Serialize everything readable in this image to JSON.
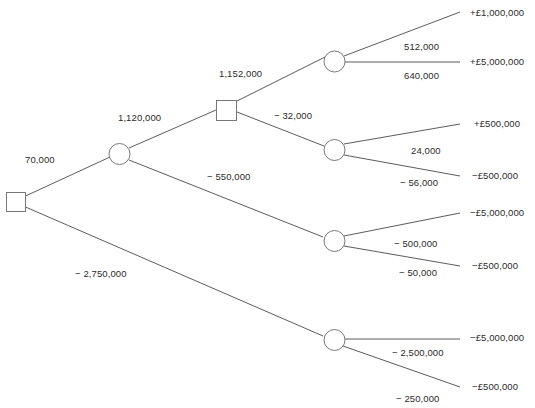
{
  "diagram": {
    "type": "decision-tree",
    "title": "",
    "nodes": {
      "root_decision": {
        "kind": "decision-square",
        "label": ""
      },
      "chance_1": {
        "kind": "chance-circle",
        "label": ""
      },
      "decision_2": {
        "kind": "decision-square",
        "label": ""
      },
      "chance_a": {
        "kind": "chance-circle",
        "label": ""
      },
      "chance_b": {
        "kind": "chance-circle",
        "label": ""
      },
      "chance_c": {
        "kind": "chance-circle",
        "label": ""
      },
      "chance_d": {
        "kind": "chance-circle",
        "label": ""
      }
    },
    "branch_values": {
      "root_upper": "70,000",
      "root_lower": "− 2,750,000",
      "chance1_upper": "1,120,000",
      "chance1_lower": "− 550,000",
      "decision2_upper": "1,152,000",
      "decision2_lower": "− 32,000",
      "chance_a_upper": "512,000",
      "chance_a_lower": "640,000",
      "chance_b_upper": "24,000",
      "chance_b_lower": "− 56,000",
      "chance_c_upper": "− 500,000",
      "chance_c_lower": "− 50,000",
      "chance_d_upper": "− 2,500,000",
      "chance_d_lower": "− 250,000"
    },
    "payoffs": [
      {
        "id": "payoff-1",
        "text": "+£1,000,000"
      },
      {
        "id": "payoff-2",
        "text": "+£5,000,000"
      },
      {
        "id": "payoff-3",
        "text": "+£500,000"
      },
      {
        "id": "payoff-4",
        "text": "−£500,000"
      },
      {
        "id": "payoff-5",
        "text": "−£5,000,000"
      },
      {
        "id": "payoff-6",
        "text": "−£500,000"
      },
      {
        "id": "payoff-7",
        "text": "−£5,000,000"
      },
      {
        "id": "payoff-8",
        "text": "−£500,000"
      }
    ],
    "colors": {
      "edge": "#4a4a4a",
      "node_stroke": "#6a6a6a",
      "text": "#2b2b2b",
      "background": "#ffffff"
    }
  }
}
